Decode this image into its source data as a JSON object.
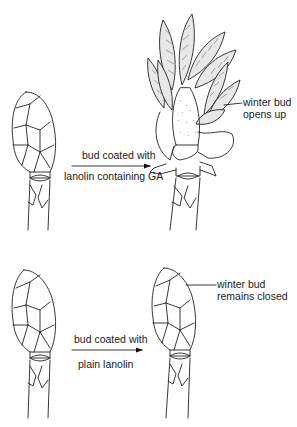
{
  "diagram": {
    "rows": [
      {
        "id": "ga-treatment",
        "arrow_label_top": "bud coated with",
        "arrow_label_bottom": "lanolin containing GA",
        "result_label_line1": "winter bud",
        "result_label_line2": "opens up"
      },
      {
        "id": "control",
        "arrow_label_top": "bud coated with",
        "arrow_label_bottom": "plain lanolin",
        "result_label_line1": "winter bud",
        "result_label_line2": "remains closed"
      }
    ],
    "colors": {
      "line": "#222222",
      "background": "#ffffff",
      "leaf_fill": "#e8e8e8"
    }
  }
}
